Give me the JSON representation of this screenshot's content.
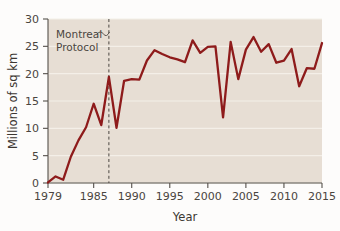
{
  "chart_data": {
    "type": "line",
    "title": "",
    "xlabel": "Year",
    "ylabel": "Millions of sq km",
    "xlim": [
      1979,
      2015
    ],
    "ylim": [
      0,
      30
    ],
    "grid": true,
    "legend": "none",
    "line_color": "#8e1b1b",
    "plot_background": "#e7ded4",
    "gridline_color": "#f4efe8",
    "x_tick_labels": [
      "1979",
      "1985",
      "1990",
      "1995",
      "2000",
      "2005",
      "2010",
      "2015"
    ],
    "x_ticks": [
      1979,
      1985,
      1990,
      1995,
      2000,
      2005,
      2010,
      2015
    ],
    "y_tick_labels": [
      "0",
      "5",
      "10",
      "15",
      "20",
      "25",
      "30"
    ],
    "y_ticks": [
      0,
      5,
      10,
      15,
      20,
      25,
      30
    ],
    "x": [
      1979,
      1980,
      1981,
      1982,
      1983,
      1984,
      1985,
      1986,
      1987,
      1988,
      1989,
      1990,
      1991,
      1992,
      1993,
      1994,
      1995,
      1996,
      1997,
      1998,
      1999,
      2000,
      2001,
      2002,
      2003,
      2004,
      2005,
      2006,
      2007,
      2008,
      2009,
      2010,
      2011,
      2012,
      2013,
      2014,
      2015
    ],
    "values": [
      0.1,
      1.2,
      0.6,
      4.8,
      7.8,
      10.2,
      14.5,
      10.6,
      19.4,
      10.1,
      18.7,
      19.0,
      18.9,
      22.4,
      24.3,
      23.6,
      23.0,
      22.6,
      22.1,
      26.1,
      23.8,
      24.9,
      25.0,
      12.0,
      25.8,
      19.0,
      24.4,
      26.7,
      24.0,
      25.4,
      22.0,
      22.4,
      24.5,
      17.7,
      21.0,
      20.9,
      25.6
    ],
    "series_name": "Antarctic ozone hole area",
    "annotation": {
      "line1": "Montreal",
      "line2": "Protocol",
      "marker_year": 1987,
      "marker_style": "dashed-vertical"
    }
  }
}
